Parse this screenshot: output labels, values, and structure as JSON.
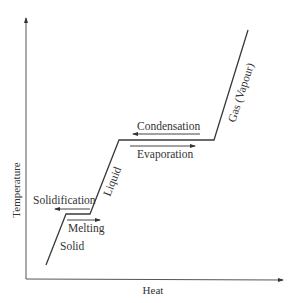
{
  "diagram": {
    "axes": {
      "x_label": "Heat",
      "y_label": "Temperature"
    },
    "phase_labels": {
      "solid": "Solid",
      "liquid": "Liquid",
      "gas": "Gas (Vapour)"
    },
    "transitions": {
      "melting": "Melting",
      "solidification": "Solidification",
      "evaporation": "Evaporation",
      "condensation": "Condensation"
    },
    "colors": {
      "line": "#3a3a3a",
      "text": "#333333",
      "background": "#ffffff"
    }
  }
}
